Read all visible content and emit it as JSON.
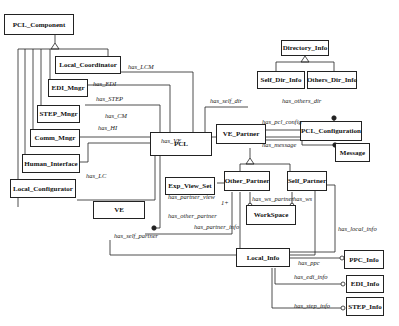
{
  "classes": {
    "pcl_component": "PCL_Component",
    "local_coordinator": "Local_Coordinator",
    "edi_mngr": "EDI_Mngr",
    "step_mngr": "STEP_Mngr",
    "comm_mngr": "Comm_Mngr",
    "human_interface": "Human_Interface",
    "local_configurator": "Local_Configurator",
    "pcl": "PCL",
    "ve": "VE",
    "directory_info": "Directory_Info",
    "self_dir_info": "Self_Dir_Info",
    "others_dir_info": "Others_Dir_Info",
    "ve_partner": "VE_Partner",
    "pcl_configuration": "PCL_Configuration",
    "message": "Message",
    "exp_view_set": "Exp_View_Set",
    "other_partner": "Other_Partner",
    "self_partner": "Self_Partner",
    "workspace": "WorkSpace",
    "local_info": "Local_Info",
    "ppc_info": "PPC_Info",
    "edi_info": "EDI_Info",
    "step_info": "STEP_Info"
  },
  "relations": {
    "has_lcm": "has_LCM",
    "has_edi": "has_EDI",
    "has_step": "has_STEP",
    "has_cm": "has_CM",
    "has_hi": "has_HI",
    "has_lc": "has_LC",
    "has_ve": "has_VE",
    "has_self_dir": "has_self_dir",
    "has_others_dir": "has_others_dir",
    "has_pcl_config": "has_pcl_config",
    "has_message": "has_message",
    "has_partner_view": "has_partner_view",
    "has_other_partner": "has_other_partner",
    "has_partner_info": "has_partner_info",
    "has_self_partner": "has_self_partner",
    "has_ws_partner": "has_ws_partner",
    "has_ws": "has_ws",
    "has_local_info": "has_local_info",
    "has_ppc": "has_ppc",
    "has_edi_info": "has_edi_info",
    "has_step_info": "has_step_info",
    "multiplicity": "1+"
  }
}
